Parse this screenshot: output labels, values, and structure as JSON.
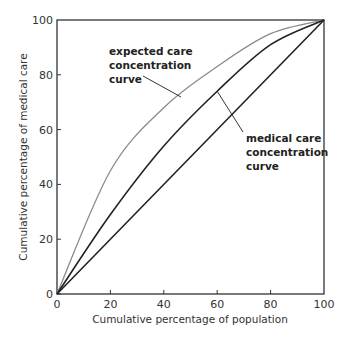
{
  "chart_data": {
    "type": "line",
    "title": "",
    "xlabel": "Cumulative percentage of population",
    "ylabel": "Cumulative percentage of medical care",
    "xlim": [
      0,
      100
    ],
    "ylim": [
      0,
      100
    ],
    "x_ticks": [
      "0",
      "20",
      "40",
      "60",
      "80",
      "100"
    ],
    "y_ticks": [
      "0",
      "20",
      "40",
      "60",
      "80",
      "100"
    ],
    "grid": false,
    "legend": "none (direct annotations)",
    "x": [
      0,
      20,
      40,
      60,
      80,
      100
    ],
    "series": [
      {
        "name": "expected care concentration curve",
        "color": "#8a8a8a",
        "values": [
          0,
          45,
          68,
          83,
          95,
          100
        ]
      },
      {
        "name": "medical care concentration curve",
        "color": "#222222",
        "values": [
          0,
          29,
          54,
          74,
          91,
          100
        ]
      },
      {
        "name": "line of equality",
        "color": "#222222",
        "values": [
          0,
          20,
          40,
          60,
          80,
          100
        ]
      }
    ],
    "annotations": [
      {
        "lines": [
          "expected care",
          "concentration",
          "curve"
        ],
        "points_to": "expected care concentration curve"
      },
      {
        "lines": [
          "medical care",
          "concentration",
          "curve"
        ],
        "points_to": "medical care concentration curve"
      }
    ]
  }
}
